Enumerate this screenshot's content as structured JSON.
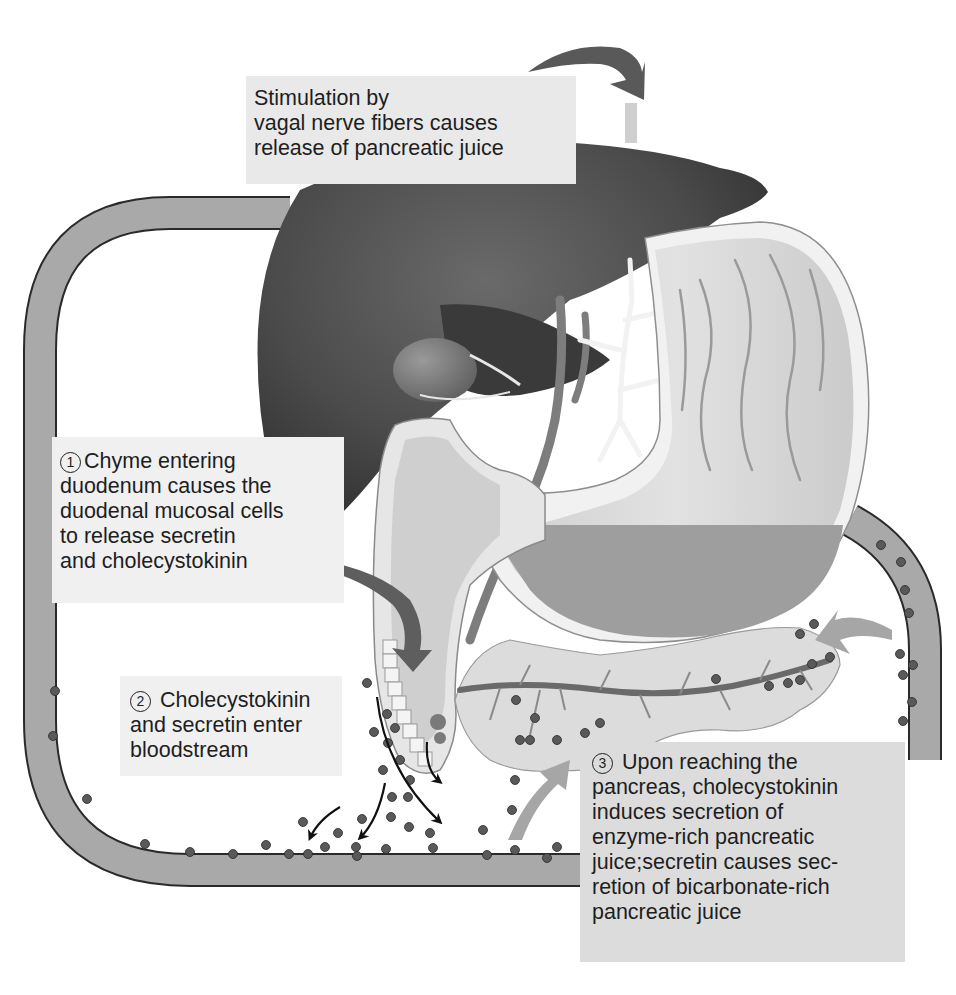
{
  "header": {
    "partial_title": "…pancreas physiology"
  },
  "diagram": {
    "organs": [
      "liver",
      "gallbladder",
      "stomach",
      "duodenum",
      "pancreas",
      "blood vessel"
    ],
    "colors": {
      "background": "#ffffff",
      "liver": "#4a4a4a",
      "gallbladder": "#7a7a7a",
      "stomach_wall": "#d9d9d9",
      "stomach_chyme": "#9c9c9c",
      "pancreas": "#d6d6d6",
      "blood_vessel": "#a9a9a9",
      "hormone_dot": "#5a5a5a",
      "callout_bg_light": "#ececec",
      "callout_bg_dark": "#dcdcdc",
      "arrow_dark": "#585858",
      "arrow_light": "#a6a6a6",
      "text": "#1e1e1e"
    }
  },
  "callouts": {
    "vagal": {
      "lines": [
        "Stimulation by",
        "vagal nerve fibers causes",
        "release of pancreatic juice"
      ]
    },
    "step1": {
      "number": "1",
      "lines": [
        "Chyme entering",
        "duodenum causes the",
        "duodenal mucosal cells",
        "to release secretin",
        "and cholecystokinin"
      ]
    },
    "step2": {
      "number": "2",
      "lines": [
        " Cholecystokinin",
        "and secretin enter",
        "bloodstream"
      ]
    },
    "step3": {
      "number": "3",
      "lines": [
        " Upon reaching the",
        "pancreas, cholecystokinin",
        "induces secretion of",
        "enzyme-rich pancreatic",
        "juice;secretin causes sec-",
        "retion of bicarbonate-rich",
        "pancreatic juice"
      ]
    }
  }
}
